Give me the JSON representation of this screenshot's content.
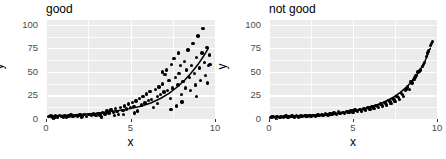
{
  "figure": {
    "width": 446,
    "height": 159,
    "panel_bg": "#ebebeb",
    "grid_color": "#ffffff",
    "point_color": "#000000",
    "curve_color": "#000000",
    "axis_text_color": "#4d4d4d"
  },
  "chart_data": [
    {
      "type": "scatter",
      "title": "good",
      "xlabel": "x",
      "ylabel": "y",
      "xlim": [
        0,
        10
      ],
      "ylim": [
        0,
        105
      ],
      "xticks": [
        0,
        5,
        10
      ],
      "yticks": [
        0,
        25,
        50,
        75,
        100
      ],
      "grid": true,
      "legend": "none",
      "annotation": "Points scatter widely around an exponential trend line; variance grows with x (heteroscedastic).",
      "fit_curve": {
        "label": "smoothed trend",
        "x": [
          0.2,
          0.8,
          1.5,
          2.2,
          3.0,
          3.7,
          4.3,
          5.0,
          5.6,
          6.2,
          6.8,
          7.3,
          7.8,
          8.2,
          8.6,
          9.0,
          9.3,
          9.6
        ],
        "y": [
          3.2,
          3.6,
          4.2,
          5.0,
          6.2,
          7.6,
          9.0,
          11.0,
          13.5,
          17.0,
          22.0,
          27.5,
          34.5,
          41.0,
          49.0,
          58.0,
          66.0,
          75.0
        ]
      },
      "points": [
        [
          0.15,
          2.5
        ],
        [
          0.3,
          3.0
        ],
        [
          0.42,
          1.8
        ],
        [
          0.55,
          3.4
        ],
        [
          0.68,
          2.2
        ],
        [
          0.8,
          3.8
        ],
        [
          0.95,
          2.6
        ],
        [
          1.08,
          4.0
        ],
        [
          1.2,
          2.0
        ],
        [
          1.35,
          3.2
        ],
        [
          1.48,
          4.4
        ],
        [
          1.6,
          2.8
        ],
        [
          1.75,
          3.6
        ],
        [
          1.88,
          2.4
        ],
        [
          2.0,
          4.2
        ],
        [
          2.15,
          3.0
        ],
        [
          2.28,
          5.0
        ],
        [
          2.4,
          2.6
        ],
        [
          2.55,
          4.6
        ],
        [
          2.68,
          3.4
        ],
        [
          2.8,
          5.4
        ],
        [
          2.95,
          3.8
        ],
        [
          3.08,
          6.0
        ],
        [
          3.2,
          4.2
        ],
        [
          3.35,
          7.0
        ],
        [
          3.48,
          5.2
        ],
        [
          3.6,
          8.5
        ],
        [
          3.72,
          6.4
        ],
        [
          3.85,
          9.5
        ],
        [
          3.98,
          7.2
        ],
        [
          4.1,
          11.0
        ],
        [
          4.2,
          8.0
        ],
        [
          4.3,
          4.5
        ],
        [
          4.42,
          12.5
        ],
        [
          4.55,
          9.0
        ],
        [
          4.65,
          14.0
        ],
        [
          4.75,
          10.5
        ],
        [
          4.88,
          16.0
        ],
        [
          5.0,
          12.0
        ],
        [
          5.1,
          17.5
        ],
        [
          5.2,
          13.0
        ],
        [
          5.32,
          19.0
        ],
        [
          5.42,
          8.5
        ],
        [
          5.55,
          21.5
        ],
        [
          5.65,
          15.0
        ],
        [
          5.75,
          24.0
        ],
        [
          5.85,
          17.0
        ],
        [
          5.95,
          26.5
        ],
        [
          6.05,
          19.5
        ],
        [
          6.15,
          29.0
        ],
        [
          6.25,
          21.0
        ],
        [
          6.35,
          12.0
        ],
        [
          6.48,
          31.5
        ],
        [
          6.58,
          24.0
        ],
        [
          6.68,
          34.0
        ],
        [
          6.78,
          26.0
        ],
        [
          6.88,
          37.0
        ],
        [
          6.98,
          28.5
        ],
        [
          7.05,
          47.0
        ],
        [
          7.12,
          52.0
        ],
        [
          7.2,
          30.0
        ],
        [
          7.28,
          41.0
        ],
        [
          7.35,
          22.0
        ],
        [
          7.42,
          58.0
        ],
        [
          7.5,
          33.0
        ],
        [
          7.58,
          64.0
        ],
        [
          7.65,
          44.0
        ],
        [
          7.72,
          14.0
        ],
        [
          7.8,
          36.0
        ],
        [
          7.88,
          48.0
        ],
        [
          7.95,
          57.0
        ],
        [
          8.02,
          26.0
        ],
        [
          8.1,
          40.0
        ],
        [
          8.18,
          61.0
        ],
        [
          8.25,
          33.0
        ],
        [
          8.32,
          52.0
        ],
        [
          8.4,
          73.0
        ],
        [
          8.48,
          44.0
        ],
        [
          8.55,
          30.0
        ],
        [
          8.62,
          57.0
        ],
        [
          8.7,
          80.0
        ],
        [
          8.78,
          48.0
        ],
        [
          8.85,
          36.0
        ],
        [
          8.92,
          65.0
        ],
        [
          9.0,
          88.0
        ],
        [
          9.08,
          54.0
        ],
        [
          9.15,
          41.0
        ],
        [
          9.22,
          70.0
        ],
        [
          9.3,
          96.0
        ],
        [
          9.38,
          60.0
        ],
        [
          9.45,
          46.0
        ],
        [
          9.52,
          76.0
        ],
        [
          9.6,
          57.0
        ],
        [
          9.68,
          68.0
        ],
        [
          4.05,
          3.5
        ],
        [
          4.6,
          5.0
        ],
        [
          5.25,
          6.5
        ],
        [
          6.6,
          16.5
        ],
        [
          7.4,
          10.0
        ],
        [
          8.05,
          18.0
        ],
        [
          8.9,
          24.0
        ],
        [
          9.55,
          38.0
        ],
        [
          3.3,
          2.2
        ],
        [
          2.1,
          1.6
        ],
        [
          1.05,
          1.4
        ],
        [
          0.5,
          1.2
        ],
        [
          6.9,
          50.0
        ],
        [
          7.85,
          70.0
        ],
        [
          9.7,
          58.0
        ]
      ]
    },
    {
      "type": "scatter",
      "title": "not good",
      "xlabel": "x",
      "ylabel": "y",
      "xlim": [
        0,
        10
      ],
      "ylim": [
        0,
        105
      ],
      "xticks": [
        0,
        5,
        10
      ],
      "yticks": [
        0,
        25,
        50,
        75,
        100
      ],
      "grid": true,
      "legend": "none",
      "annotation": "Points lie tightly along an exponential trend with very small, constant scatter.",
      "fit_curve": {
        "label": "smoothed trend",
        "x": [
          0.2,
          0.8,
          1.5,
          2.2,
          3.0,
          3.7,
          4.3,
          5.0,
          5.6,
          6.2,
          6.8,
          7.3,
          7.8,
          8.2,
          8.6,
          9.0,
          9.3,
          9.6
        ],
        "y": [
          2.0,
          2.3,
          2.8,
          3.4,
          4.3,
          5.4,
          6.6,
          8.4,
          10.5,
          13.5,
          17.5,
          22.0,
          28.0,
          34.0,
          42.0,
          52.0,
          62.0,
          75.0
        ]
      },
      "points": [
        [
          0.12,
          1.8
        ],
        [
          0.25,
          2.4
        ],
        [
          0.38,
          1.5
        ],
        [
          0.5,
          2.6
        ],
        [
          0.62,
          1.9
        ],
        [
          0.75,
          2.8
        ],
        [
          0.88,
          2.1
        ],
        [
          1.0,
          3.0
        ],
        [
          1.12,
          1.7
        ],
        [
          1.25,
          2.5
        ],
        [
          1.38,
          3.2
        ],
        [
          1.5,
          2.2
        ],
        [
          1.62,
          3.4
        ],
        [
          1.75,
          2.0
        ],
        [
          1.88,
          3.1
        ],
        [
          2.0,
          2.7
        ],
        [
          2.12,
          3.8
        ],
        [
          2.25,
          2.4
        ],
        [
          2.38,
          3.6
        ],
        [
          2.5,
          2.9
        ],
        [
          2.62,
          4.0
        ],
        [
          2.75,
          3.2
        ],
        [
          2.88,
          4.4
        ],
        [
          3.0,
          3.5
        ],
        [
          3.12,
          4.8
        ],
        [
          3.25,
          3.8
        ],
        [
          3.38,
          5.2
        ],
        [
          3.5,
          4.2
        ],
        [
          3.62,
          5.6
        ],
        [
          3.75,
          4.6
        ],
        [
          3.88,
          6.2
        ],
        [
          4.0,
          5.0
        ],
        [
          4.12,
          7.8
        ],
        [
          4.25,
          5.6
        ],
        [
          4.38,
          7.0
        ],
        [
          4.5,
          6.0
        ],
        [
          4.62,
          8.2
        ],
        [
          4.75,
          6.6
        ],
        [
          4.88,
          8.8
        ],
        [
          5.0,
          7.2
        ],
        [
          5.12,
          9.4
        ],
        [
          5.25,
          7.8
        ],
        [
          5.38,
          10.2
        ],
        [
          5.5,
          8.6
        ],
        [
          5.62,
          11.0
        ],
        [
          5.75,
          9.4
        ],
        [
          5.88,
          12.0
        ],
        [
          6.0,
          10.2
        ],
        [
          6.12,
          13.2
        ],
        [
          6.25,
          11.2
        ],
        [
          6.38,
          14.5
        ],
        [
          6.5,
          12.4
        ],
        [
          6.62,
          16.0
        ],
        [
          6.75,
          13.6
        ],
        [
          6.88,
          17.6
        ],
        [
          7.0,
          15.0
        ],
        [
          7.12,
          19.5
        ],
        [
          7.25,
          16.6
        ],
        [
          7.38,
          21.5
        ],
        [
          7.5,
          18.4
        ],
        [
          7.62,
          24.0
        ],
        [
          7.75,
          20.4
        ],
        [
          7.88,
          27.0
        ],
        [
          8.0,
          24.0
        ],
        [
          8.12,
          30.0
        ],
        [
          8.25,
          34.0
        ],
        [
          8.38,
          31.0
        ],
        [
          8.5,
          38.0
        ],
        [
          8.62,
          42.0
        ],
        [
          8.75,
          46.0
        ],
        [
          8.88,
          50.0
        ],
        [
          9.0,
          52.0
        ],
        [
          9.12,
          56.0
        ],
        [
          9.25,
          60.0
        ],
        [
          9.38,
          66.0
        ],
        [
          9.5,
          72.0
        ],
        [
          9.62,
          78.0
        ],
        [
          9.72,
          82.0
        ],
        [
          0.18,
          2.2
        ],
        [
          0.44,
          2.0
        ],
        [
          0.7,
          2.3
        ],
        [
          0.95,
          2.6
        ],
        [
          1.2,
          2.8
        ],
        [
          1.45,
          2.6
        ],
        [
          1.7,
          2.9
        ],
        [
          1.95,
          3.3
        ],
        [
          2.2,
          3.0
        ],
        [
          2.45,
          3.4
        ],
        [
          2.7,
          3.7
        ],
        [
          2.95,
          4.1
        ],
        [
          3.2,
          4.4
        ],
        [
          3.45,
          4.9
        ],
        [
          3.7,
          5.3
        ],
        [
          3.95,
          5.9
        ],
        [
          4.2,
          6.4
        ],
        [
          4.45,
          7.2
        ],
        [
          4.7,
          7.6
        ],
        [
          4.95,
          8.4
        ],
        [
          5.2,
          9.0
        ],
        [
          5.45,
          9.8
        ],
        [
          5.7,
          10.8
        ],
        [
          5.95,
          11.6
        ],
        [
          6.2,
          12.8
        ],
        [
          6.45,
          14.0
        ],
        [
          6.7,
          15.4
        ],
        [
          6.95,
          17.0
        ],
        [
          7.2,
          18.8
        ],
        [
          7.45,
          20.8
        ],
        [
          7.7,
          23.0
        ],
        [
          7.95,
          26.0
        ],
        [
          8.2,
          32.0
        ],
        [
          8.45,
          40.0
        ],
        [
          8.7,
          44.0
        ],
        [
          8.95,
          51.0
        ],
        [
          9.2,
          58.0
        ],
        [
          9.45,
          70.0
        ],
        [
          9.66,
          80.0
        ]
      ]
    }
  ]
}
